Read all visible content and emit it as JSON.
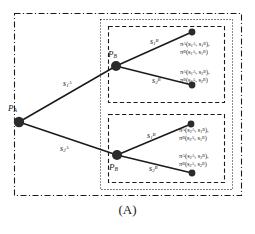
{
  "figure": {
    "caption": "(A)",
    "nodes": {
      "root": {
        "label_html": "P<sub>A</sub>",
        "label_plain": "P_A"
      },
      "upper_decision": {
        "label_html": "P<sub>B</sub>",
        "label_plain": "P_B"
      },
      "lower_decision": {
        "label_html": "P<sub>B</sub>",
        "label_plain": "P_B"
      }
    },
    "edges": [
      {
        "name": "edge-root-upper",
        "label_html": "s<sub>1</sub><sup>A</sup>",
        "label_plain": "s_1^A"
      },
      {
        "name": "edge-root-lower",
        "label_html": "s<sub>2</sub><sup>A</sup>",
        "label_plain": "s_2^A"
      },
      {
        "name": "edge-upper-first",
        "label_html": "s<sub>1</sub><sup>B</sup>",
        "label_plain": "s_1^B"
      },
      {
        "name": "edge-upper-second",
        "label_html": "s<sub>2</sub><sup>B</sup>",
        "label_plain": "s_2^B"
      },
      {
        "name": "edge-lower-first",
        "label_html": "s<sub>1</sub><sup>B</sup>",
        "label_plain": "s_1^B"
      },
      {
        "name": "edge-lower-second",
        "label_html": "s<sub>2</sub><sup>B</sup>",
        "label_plain": "s_2^B"
      }
    ],
    "payoffs": [
      {
        "name": "payoff-terminal-11",
        "line1_html": "&pi;<sup>A</sup>(s<sub>1</sub><sup>A</sup>, s<sub>1</sub><sup>B</sup>),",
        "line2_html": "&pi;<sup>B</sup>(s<sub>1</sub><sup>A</sup>, s<sub>1</sub><sup>B</sup>)",
        "plain": "pi^A(s_1^A, s_1^B), pi^B(s_1^A, s_1^B)"
      },
      {
        "name": "payoff-terminal-12",
        "line1_html": "&pi;<sup>A</sup>(s<sub>1</sub><sup>A</sup>, s<sub>2</sub><sup>B</sup>),",
        "line2_html": "&pi;<sup>B</sup>(s<sub>1</sub><sup>A</sup>, s<sub>2</sub><sup>B</sup>)",
        "plain": "pi^A(s_1^A, s_2^B), pi^B(s_1^A, s_2^B)"
      },
      {
        "name": "payoff-terminal-21",
        "line1_html": "&pi;<sup>A</sup>(s<sub>2</sub><sup>A</sup>, s<sub>1</sub><sup>B</sup>),",
        "line2_html": "&pi;<sup>B</sup>(s<sub>2</sub><sup>A</sup>, s<sub>1</sub><sup>B</sup>)",
        "plain": "pi^A(s_2^A, s_1^B), pi^B(s_2^A, s_1^B)"
      },
      {
        "name": "payoff-terminal-22",
        "line1_html": "&pi;<sup>A</sup>(s<sub>2</sub><sup>A</sup>, s<sub>2</sub><sup>B</sup>),",
        "line2_html": "&pi;<sup>B</sup>(s<sub>2</sub><sup>A</sup>, s<sub>2</sub><sup>B</sup>)",
        "plain": "pi^A(s_2^A, s_2^B), pi^B(s_2^A, s_2^B)"
      }
    ],
    "boxes": [
      {
        "name": "outer-box",
        "style": "dash-dot"
      },
      {
        "name": "middle-box",
        "style": "dotted"
      },
      {
        "name": "inner-box-upper",
        "style": "dashed"
      },
      {
        "name": "inner-box-lower",
        "style": "dashed"
      }
    ],
    "colors": {
      "stroke": "#1a1a1a",
      "node_fill": "#2b2b2b",
      "background": "#ffffff"
    }
  }
}
